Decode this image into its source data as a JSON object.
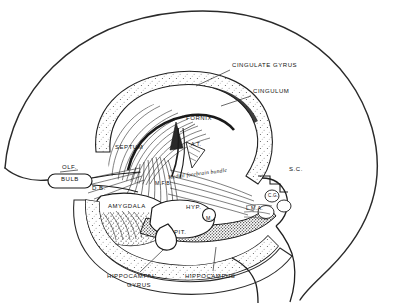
{
  "figure": {
    "style": "black and white pen-and-ink anatomical line drawing",
    "background_color": "#ffffff",
    "ink_color": "#111111"
  },
  "labels": [
    {
      "id": "cingulate-gyrus",
      "text": "CINGULATE GYRUS",
      "x": 232,
      "y": 66,
      "size": "normal",
      "leader": [
        [
          230,
          70
        ],
        [
          196,
          86
        ]
      ]
    },
    {
      "id": "cingulum",
      "text": "CINGULUM",
      "x": 253,
      "y": 92,
      "size": "normal",
      "leader": [
        [
          251,
          96
        ],
        [
          221,
          106
        ]
      ]
    },
    {
      "id": "fornix",
      "text": "FORNIX",
      "x": 186,
      "y": 119,
      "size": "normal",
      "leader": [
        [
          195,
          124
        ],
        [
          178,
          133
        ]
      ]
    },
    {
      "id": "septum",
      "text": "SEPTUM",
      "x": 115,
      "y": 148,
      "size": "normal",
      "leader": null
    },
    {
      "id": "olfactory",
      "text": "OLF.",
      "x": 62,
      "y": 168,
      "size": "normal",
      "leader": null
    },
    {
      "id": "bulb",
      "text": "BULB",
      "x": 61,
      "y": 180,
      "size": "normal",
      "leader": null
    },
    {
      "id": "diagonal-band",
      "text": "D.B.",
      "x": 92,
      "y": 189,
      "size": "normal",
      "leader": null
    },
    {
      "id": "amygdala",
      "text": "AMYGDALA",
      "x": 108,
      "y": 207,
      "size": "normal",
      "leader": null
    },
    {
      "id": "mfb",
      "text": "M.F.B.",
      "x": 155,
      "y": 184,
      "size": "sm",
      "leader": null
    },
    {
      "id": "anterior-thalamus",
      "text": "A.T.",
      "x": 191,
      "y": 145,
      "size": "sm",
      "leader": null
    },
    {
      "id": "medial-forebrain-bundle",
      "text": "Medial forebrain bundle",
      "x": 168,
      "y": 179,
      "size": "script",
      "leader": null
    },
    {
      "id": "hypothalamus",
      "text": "HYP.",
      "x": 186,
      "y": 208,
      "size": "normal",
      "leader": null
    },
    {
      "id": "mammillary",
      "text": "M.",
      "x": 206,
      "y": 219,
      "size": "sm",
      "leader": null
    },
    {
      "id": "pituitary",
      "text": "PIT.",
      "x": 174,
      "y": 233,
      "size": "normal",
      "leader": null
    },
    {
      "id": "superior-colliculus",
      "text": "S.C.",
      "x": 289,
      "y": 170,
      "size": "normal",
      "leader": null
    },
    {
      "id": "central-gray",
      "text": "C.G.",
      "x": 279,
      "y": 192,
      "size": "tiny",
      "leader": null
    },
    {
      "id": "lma",
      "text": "L.M.A.",
      "x": 248,
      "y": 207,
      "size": "sm",
      "leader": null
    },
    {
      "id": "hippocampal-gyrus-1",
      "text": "HIPPOCAMPAL",
      "x": 107,
      "y": 277,
      "size": "normal",
      "leader": [
        [
          140,
          274
        ],
        [
          162,
          252
        ]
      ]
    },
    {
      "id": "hippocampal-gyrus-2",
      "text": "GYRUS",
      "x": 127,
      "y": 286,
      "size": "normal",
      "leader": null
    },
    {
      "id": "hippocampus",
      "text": "HIPPOCAMPUS",
      "x": 185,
      "y": 277,
      "size": "normal",
      "leader": [
        [
          213,
          273
        ],
        [
          216,
          248
        ]
      ]
    }
  ]
}
